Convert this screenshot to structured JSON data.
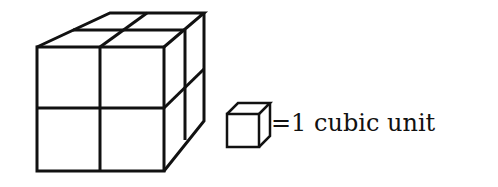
{
  "diagram": {
    "type": "unit-cube-volume",
    "large_cube": {
      "cubes_per_edge": 2,
      "total_unit_cubes": 8
    },
    "legend": {
      "icon": "unit-cube-icon",
      "text": "=1 cubic unit"
    },
    "colors": {
      "stroke": "#111111",
      "background": "#ffffff"
    }
  }
}
